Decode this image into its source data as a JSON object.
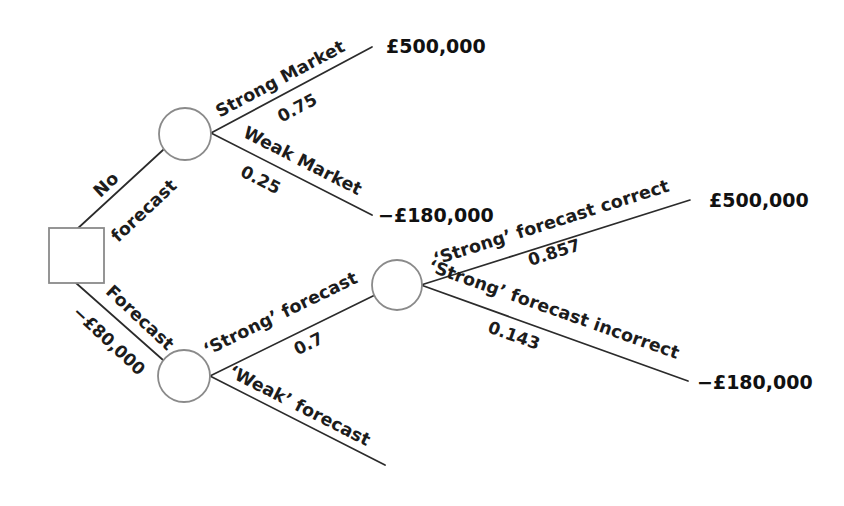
{
  "diagram": {
    "type": "decision-tree",
    "currency_symbol": "£",
    "colors": {
      "background": "#ffffff",
      "branch_line": "#2b2b2b",
      "node_stroke": "#8a8a8a",
      "node_fill": "#ffffff",
      "text": "#1c1c1c"
    }
  },
  "nodes": {
    "decision": {
      "name": "decision-node",
      "shape": "square",
      "x": 76,
      "y": 256,
      "size": 55
    },
    "no_forecast_chance": {
      "name": "no-forecast-chance-node",
      "shape": "circle",
      "x": 185,
      "y": 134,
      "r": 26
    },
    "forecast_chance": {
      "name": "forecast-chance-node",
      "shape": "circle",
      "x": 184,
      "y": 376,
      "r": 26
    },
    "strong_forecast_chance": {
      "name": "strong-forecast-chance-node",
      "shape": "circle",
      "x": 397,
      "y": 285,
      "r": 25
    }
  },
  "branches": [
    {
      "id": "no-forecast",
      "label": "No",
      "label2": "forecast",
      "probability": "",
      "payoff": "",
      "x1": 76,
      "y1": 230,
      "x2": 163,
      "y2": 150
    },
    {
      "id": "forecast",
      "label": "Forecast",
      "probability": "",
      "cost": "−£80,000",
      "payoff": "",
      "x1": 76,
      "y1": 283,
      "x2": 163,
      "y2": 360
    },
    {
      "id": "strong-market",
      "label": "Strong Market",
      "probability": "0.75",
      "payoff": "£500,000",
      "x1": 211,
      "y1": 133,
      "x2": 372,
      "y2": 47
    },
    {
      "id": "weak-market",
      "label": "Weak Market",
      "probability": "0.25",
      "payoff": "−£180,000",
      "x1": 211,
      "y1": 133,
      "x2": 372,
      "y2": 215
    },
    {
      "id": "strong-forecast",
      "label": "'Strong' forecast",
      "probability": "0.7",
      "payoff": "",
      "x1": 210,
      "y1": 376,
      "x2": 375,
      "y2": 295
    },
    {
      "id": "weak-forecast",
      "label": "'Weak' forecast",
      "probability": "",
      "payoff": "",
      "x1": 210,
      "y1": 376,
      "x2": 385,
      "y2": 465
    },
    {
      "id": "strong-forecast-correct",
      "label": "'Strong' forecast correct",
      "probability": "0.857",
      "payoff": "£500,000",
      "x1": 421,
      "y1": 285,
      "x2": 690,
      "y2": 200
    },
    {
      "id": "strong-forecast-incorrect",
      "label": "'Strong' forecast incorrect",
      "probability": "0.143",
      "payoff": "−£180,000",
      "x1": 421,
      "y1": 285,
      "x2": 688,
      "y2": 381
    }
  ],
  "labels": {
    "no": "No",
    "forecast_word": "forecast",
    "forecast": "Forecast",
    "forecast_cost": "−£80,000",
    "strong_market": "Strong Market",
    "strong_market_prob": "0.75",
    "strong_market_payoff": "£500,000",
    "weak_market": "Weak Market",
    "weak_market_prob": "0.25",
    "weak_market_payoff": "−£180,000",
    "strong_forecast": "‘Strong’ forecast",
    "strong_forecast_prob": "0.7",
    "weak_forecast": "‘Weak’ forecast",
    "strong_forecast_correct": "‘Strong’ forecast correct",
    "strong_forecast_correct_prob": "0.857",
    "strong_forecast_correct_payoff": "£500,000",
    "strong_forecast_incorrect": "‘Strong’ forecast incorrect",
    "strong_forecast_incorrect_prob": "0.143",
    "strong_forecast_incorrect_payoff": "−£180,000"
  }
}
